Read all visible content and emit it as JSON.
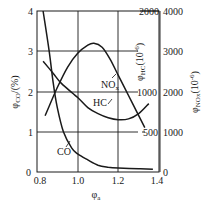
{
  "chart_data": {
    "type": "line",
    "title": "",
    "xlabel": "φa",
    "x_ticks": [
      "0.8",
      "1.0",
      "1.2",
      "1.4"
    ],
    "xlim": [
      0.8,
      1.4
    ],
    "grid": true,
    "axes": {
      "left": {
        "label": "φCO/(%)",
        "ticks": [
          "0",
          "1",
          "2",
          "3",
          "4"
        ],
        "range": [
          0,
          4
        ]
      },
      "right_inner": {
        "label": "φHC(10⁻⁶)",
        "ticks": [
          "500",
          "1000",
          "2000"
        ],
        "range": [
          0,
          2000
        ]
      },
      "right_outer": {
        "label": "φNOx(10⁻⁶)",
        "ticks": [
          "0",
          "1000",
          "2000",
          "3000",
          "4000"
        ],
        "range": [
          0,
          4000
        ]
      }
    },
    "series": [
      {
        "name": "CO",
        "axis": "left",
        "unit": "%",
        "x": [
          0.83,
          0.86,
          0.88,
          0.9,
          0.93,
          0.97,
          1.0,
          1.05,
          1.1,
          1.15,
          1.2,
          1.3,
          1.37
        ],
        "values": [
          4.0,
          3.0,
          2.2,
          1.6,
          1.0,
          0.6,
          0.45,
          0.3,
          0.17,
          0.12,
          0.1,
          0.08,
          0.07
        ]
      },
      {
        "name": "NOx",
        "axis": "right_outer",
        "unit": "10^-6",
        "x": [
          0.84,
          0.9,
          0.95,
          1.0,
          1.05,
          1.08,
          1.12,
          1.16,
          1.2,
          1.25,
          1.3,
          1.33
        ],
        "values": [
          1400,
          2100,
          2600,
          2950,
          3150,
          3200,
          3100,
          2800,
          2400,
          1900,
          1400,
          1100
        ]
      },
      {
        "name": "HC",
        "axis": "right_inner",
        "unit": "10^-6",
        "x": [
          0.83,
          0.88,
          0.92,
          1.0,
          1.05,
          1.1,
          1.15,
          1.2,
          1.25,
          1.3,
          1.35
        ],
        "values": [
          1375,
          1225,
          1100,
          925,
          800,
          725,
          675,
          650,
          660,
          725,
          850
        ]
      }
    ],
    "annotations": [
      "CO",
      "HC",
      "NOx"
    ]
  },
  "labels": {
    "y_left": "φ",
    "y_left_sub": "CO",
    "y_left_unit": "/(%)",
    "y_hc": "φ",
    "y_hc_sub": "HC",
    "y_hc_unit": "(10",
    "y_hc_exp": "-6",
    "y_nox": "φ",
    "y_nox_sub": "NOx",
    "y_nox_unit": "(10",
    "y_nox_exp": "-6",
    "x": "φ",
    "x_sub": "a",
    "co": "CO",
    "hc": "HC",
    "nox": "NO",
    "nox_sub": "x",
    "close_paren": ")"
  }
}
